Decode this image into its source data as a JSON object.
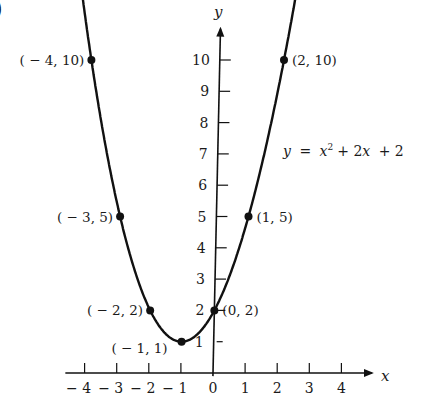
{
  "chart_data": {
    "type": "line",
    "title": "",
    "equation": {
      "lhs": "y",
      "rhs_parts": [
        "x",
        "2",
        "+ 2",
        "x",
        "+ 2"
      ],
      "text": "y = x² + 2x + 2"
    },
    "xlabel": "x",
    "ylabel": "y",
    "xlim": [
      -4,
      4
    ],
    "ylim": [
      0,
      10
    ],
    "x_ticks": [
      -4,
      -3,
      -2,
      -1,
      0,
      1,
      2,
      3,
      4
    ],
    "x_tick_labels": [
      "− 4",
      "− 3",
      "− 2",
      "− 1",
      "0",
      "1",
      "2",
      "3",
      "4"
    ],
    "y_ticks": [
      1,
      2,
      3,
      4,
      5,
      6,
      7,
      8,
      9,
      10
    ],
    "y_tick_labels": [
      "1",
      "2",
      "3",
      "4",
      "5",
      "6",
      "7",
      "8",
      "9",
      "10"
    ],
    "grid": false,
    "legend": null,
    "series": [
      {
        "name": "y = x² + 2x + 2",
        "function": "x^2 + 2x + 2",
        "x": [
          -4,
          -3,
          -2,
          -1,
          0,
          1,
          2
        ],
        "y": [
          10,
          5,
          2,
          1,
          2,
          5,
          10
        ]
      }
    ],
    "annotations": [
      {
        "x": -4,
        "y": 10,
        "label": "( − 4, 10)",
        "side": "left"
      },
      {
        "x": -3,
        "y": 5,
        "label": "( − 3, 5)",
        "side": "left"
      },
      {
        "x": -2,
        "y": 2,
        "label": "( − 2, 2)",
        "side": "left"
      },
      {
        "x": -1,
        "y": 1,
        "label": "( − 1, 1)",
        "side": "below-left"
      },
      {
        "x": 0,
        "y": 2,
        "label": "(0, 2)",
        "side": "right"
      },
      {
        "x": 1,
        "y": 5,
        "label": "(1, 5)",
        "side": "right"
      },
      {
        "x": 2,
        "y": 10,
        "label": "(2, 10)",
        "side": "right"
      }
    ]
  },
  "figure": {
    "corner_mark": ")"
  }
}
